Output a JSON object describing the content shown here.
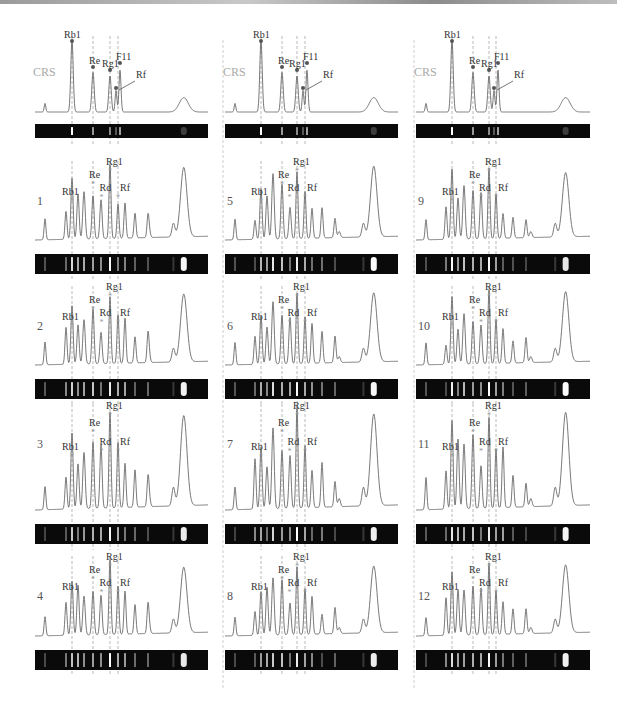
{
  "figure": {
    "reference_label": "CRS",
    "columns": [
      {
        "x0": 35,
        "x1": 208,
        "guides": [
          72,
          93,
          110,
          118
        ]
      },
      {
        "x0": 225,
        "x1": 398,
        "guides": [
          261,
          282,
          297,
          305
        ]
      },
      {
        "x0": 416,
        "x1": 590,
        "guides": [
          452,
          473,
          489,
          496
        ]
      }
    ],
    "reference_peaks": {
      "labels": [
        "Rb1",
        "Re",
        "Rg1",
        "F11",
        "Rf"
      ],
      "annotation_arrow_target": "Rf"
    },
    "panels": [
      {
        "id": "CRS-1",
        "col": 0,
        "row": 0,
        "label": "CRS",
        "is_reference": true,
        "peak_labels": [
          "Rb1",
          "Re",
          "Rg1",
          "F11",
          "Rf"
        ]
      },
      {
        "id": "CRS-2",
        "col": 1,
        "row": 0,
        "label": "CRS",
        "is_reference": true,
        "peak_labels": [
          "Rb1",
          "Re",
          "Rg1",
          "F11",
          "Rf"
        ]
      },
      {
        "id": "CRS-3",
        "col": 2,
        "row": 0,
        "label": "CRS",
        "is_reference": true,
        "peak_labels": [
          "Rb1",
          "Re",
          "Rg1",
          "F11",
          "Rf"
        ]
      },
      {
        "id": "1",
        "col": 0,
        "row": 1,
        "label": "1",
        "peak_labels": [
          "Rb1",
          "Re",
          "Rd",
          "Rg1",
          "Rf"
        ]
      },
      {
        "id": "2",
        "col": 0,
        "row": 2,
        "label": "2",
        "peak_labels": [
          "Rb1",
          "Re",
          "Rd",
          "Rg1",
          "Rf"
        ]
      },
      {
        "id": "3",
        "col": 0,
        "row": 3,
        "label": "3",
        "peak_labels": [
          "Rb1",
          "Re",
          "Rd",
          "Rg1",
          "Rf"
        ]
      },
      {
        "id": "4",
        "col": 0,
        "row": 4,
        "label": "4",
        "peak_labels": [
          "Rb1",
          "Re",
          "Rd",
          "Rg1",
          "Rf"
        ]
      },
      {
        "id": "5",
        "col": 1,
        "row": 1,
        "label": "5",
        "peak_labels": [
          "Rb1",
          "Re",
          "Rd",
          "Rg1",
          "Rf"
        ]
      },
      {
        "id": "6",
        "col": 1,
        "row": 2,
        "label": "6",
        "peak_labels": [
          "Rb1",
          "Re",
          "Rd",
          "Rg1",
          "Rf"
        ]
      },
      {
        "id": "7",
        "col": 1,
        "row": 3,
        "label": "7",
        "peak_labels": [
          "Rb1",
          "Re",
          "Rd",
          "Rg1",
          "Rf"
        ]
      },
      {
        "id": "8",
        "col": 1,
        "row": 4,
        "label": "8",
        "peak_labels": [
          "Rb1",
          "Re",
          "Rd",
          "Rg1",
          "Rf"
        ]
      },
      {
        "id": "9",
        "col": 2,
        "row": 1,
        "label": "9",
        "peak_labels": [
          "Rb1",
          "Re",
          "Rd",
          "Rg1",
          "Rf"
        ]
      },
      {
        "id": "10",
        "col": 2,
        "row": 2,
        "label": "10",
        "peak_labels": [
          "Rb1",
          "Re",
          "Rd",
          "Rg1",
          "Rf"
        ]
      },
      {
        "id": "11",
        "col": 2,
        "row": 3,
        "label": "11",
        "peak_labels": [
          "Rb1",
          "Re",
          "Rd",
          "Rg1",
          "Rf"
        ]
      },
      {
        "id": "12",
        "col": 2,
        "row": 4,
        "label": "12",
        "peak_labels": [
          "Rb1",
          "Re",
          "Rd",
          "Rg1",
          "Rf"
        ]
      }
    ]
  },
  "chart_data": {
    "type": "line",
    "title": "",
    "xlabel": "",
    "ylabel": "",
    "grid": false,
    "legend": null,
    "reference": {
      "name": "CRS",
      "peaks": [
        {
          "label": "Rb1",
          "relative_height": 1.0
        },
        {
          "label": "Re",
          "relative_height": 0.55
        },
        {
          "label": "Rg1",
          "relative_height": 0.5
        },
        {
          "label": "F11",
          "relative_height": 0.58
        },
        {
          "label": "Rf",
          "relative_height": 0.3
        }
      ]
    },
    "series": [
      {
        "name": "1",
        "marked_peaks": [
          "Rb1",
          "Re",
          "Rd",
          "Rg1",
          "Rf"
        ]
      },
      {
        "name": "2",
        "marked_peaks": [
          "Rb1",
          "Re",
          "Rd",
          "Rg1",
          "Rf"
        ]
      },
      {
        "name": "3",
        "marked_peaks": [
          "Rb1",
          "Re",
          "Rd",
          "Rg1",
          "Rf"
        ]
      },
      {
        "name": "4",
        "marked_peaks": [
          "Rb1",
          "Re",
          "Rd",
          "Rg1",
          "Rf"
        ]
      },
      {
        "name": "5",
        "marked_peaks": [
          "Rb1",
          "Re",
          "Rd",
          "Rg1",
          "Rf"
        ]
      },
      {
        "name": "6",
        "marked_peaks": [
          "Rb1",
          "Re",
          "Rd",
          "Rg1",
          "Rf"
        ]
      },
      {
        "name": "7",
        "marked_peaks": [
          "Rb1",
          "Re",
          "Rd",
          "Rg1",
          "Rf"
        ]
      },
      {
        "name": "8",
        "marked_peaks": [
          "Rb1",
          "Re",
          "Rd",
          "Rg1",
          "Rf"
        ]
      },
      {
        "name": "9",
        "marked_peaks": [
          "Rb1",
          "Re",
          "Rd",
          "Rg1",
          "Rf"
        ]
      },
      {
        "name": "10",
        "marked_peaks": [
          "Rb1",
          "Re",
          "Rd",
          "Rg1",
          "Rf"
        ]
      },
      {
        "name": "11",
        "marked_peaks": [
          "Rb1",
          "Re",
          "Rd",
          "Rg1",
          "Rf"
        ]
      },
      {
        "name": "12",
        "marked_peaks": [
          "Rb1",
          "Re",
          "Rd",
          "Rg1",
          "Rf"
        ]
      }
    ]
  }
}
